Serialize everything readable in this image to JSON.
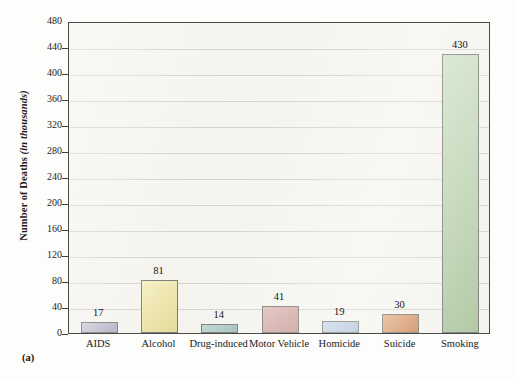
{
  "figure": {
    "panel_label": "(a)",
    "y_axis_title_main": "Number of Deaths ",
    "y_axis_title_italic": "(in thousands)"
  },
  "chart_data": {
    "type": "bar",
    "title": "",
    "xlabel": "",
    "ylabel": "Number of Deaths (in thousands)",
    "ylim": [
      0,
      480
    ],
    "ytick_step": 40,
    "yticks": [
      0,
      40,
      80,
      120,
      160,
      200,
      240,
      280,
      320,
      360,
      400,
      440,
      480
    ],
    "grid": true,
    "legend": "none",
    "categories": [
      "AIDS",
      "Alcohol",
      "Drug-induced",
      "Motor Vehicle",
      "Homicide",
      "Suicide",
      "Smoking"
    ],
    "values": [
      17,
      81,
      14,
      41,
      19,
      30,
      430
    ],
    "value_labels": [
      "17",
      "81",
      "14",
      "41",
      "19",
      "30",
      "430"
    ],
    "bar_colors": [
      "#b3b0c8",
      "#f2e79a",
      "#9cc3c0",
      "#cf9a94",
      "#aec4dd",
      "#d4854c",
      "#b1cfa3"
    ],
    "bar_border_color": "#6d6d66",
    "plot_background": "#f4f3ee",
    "gridline_color": "#c9c8c0",
    "axis_color": "#4a4a48"
  }
}
